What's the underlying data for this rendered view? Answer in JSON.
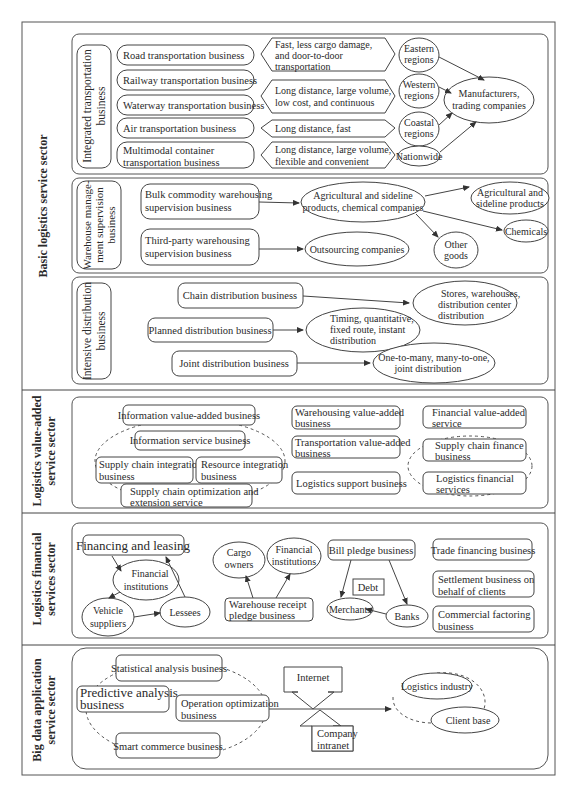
{
  "sectors": {
    "basic": {
      "label": "Basic logistics service sector",
      "transport": {
        "group_label_1": "Integrated transportation",
        "group_label_2": "business",
        "businesses": [
          [
            "Road transportation business"
          ],
          [
            "Railway transportation business"
          ],
          [
            "Waterway transportation business"
          ],
          [
            "Air transportation business"
          ],
          [
            "Multimodal container",
            "transportation business"
          ]
        ],
        "features": [
          [
            "Fast, less cargo damage,",
            "and door-to-door",
            "transportation"
          ],
          [
            "Long distance, large volume,",
            "low cost, and continuous"
          ],
          [
            "Long distance, fast"
          ],
          [
            "Long distance, large volume,",
            "flexible and convenient"
          ]
        ],
        "regions": [
          [
            "Eastern",
            "regions"
          ],
          [
            "Western",
            "regions"
          ],
          [
            "Coastal",
            "regions"
          ],
          [
            "Nationwide"
          ]
        ],
        "target": [
          "Manufacturers,",
          "trading companies"
        ]
      },
      "warehouse": {
        "group_label": [
          "Warehouse manage-",
          "ment supervision",
          "business"
        ],
        "businesses": [
          [
            "Bulk commodity warehousing",
            "supervision business"
          ],
          [
            "Third-party warehousing",
            "supervision business"
          ]
        ],
        "clients": [
          [
            "Agricultural and sideline",
            "products, chemical companies"
          ],
          [
            "Outsourcing companies"
          ]
        ],
        "goods": [
          [
            "Agricultural and",
            "sideline products"
          ],
          [
            "Chemicals"
          ],
          [
            "Other",
            "goods"
          ]
        ]
      },
      "distribution": {
        "group_label": [
          "Intensive distribution",
          "business"
        ],
        "businesses": [
          "Chain distribution business",
          "Planned distribution business",
          "Joint distribution business"
        ],
        "outcomes": [
          [
            "Stores, warehouses,",
            "distribution center",
            "distribution"
          ],
          [
            "Timing, quantitative,",
            "fixed route, instant",
            "distribution"
          ],
          [
            "One-to-many, many-to-one,",
            "joint distribution"
          ]
        ]
      }
    },
    "value_added": {
      "label": [
        "Logistics value-added",
        "service sector"
      ],
      "info_value_added": "Information value-added business",
      "info_service": "Information service business",
      "supply_chain_integration": [
        "Supply chain integration",
        "business"
      ],
      "resource_integration": [
        "Resource integration",
        "business"
      ],
      "supply_chain_optimization": [
        "Supply chain optimization and",
        "extension service"
      ],
      "warehousing_va": [
        "Warehousing value-added",
        "business"
      ],
      "transportation_va": [
        "Transportation value-added",
        "business"
      ],
      "logistics_support": "Logistics support business",
      "financial_va": [
        "Financial value-added",
        "service"
      ],
      "supply_chain_finance": [
        "Supply chain finance",
        "business"
      ],
      "logistics_financial": [
        "Logistics financial",
        "services"
      ]
    },
    "financial": {
      "label": [
        "Logistics financial",
        "services sector"
      ],
      "financing_leasing": "Financing and leasing",
      "financial_institutions": [
        "Financial",
        "institutions"
      ],
      "vehicle_suppliers": [
        "Vehicle",
        "suppliers"
      ],
      "lessees": "Lessees",
      "cargo_owners": [
        "Cargo",
        "owners"
      ],
      "financial_institutions_2": [
        "Financial",
        "institutions"
      ],
      "warehouse_receipt": [
        "Warehouse receipt",
        "pledge business"
      ],
      "bill_pledge": "Bill pledge business",
      "debt": "Debt",
      "merchants": "Merchants",
      "banks": "Banks",
      "trade_financing": "Trade financing business",
      "settlement": [
        "Settlement business on",
        "behalf of clients"
      ],
      "factoring": [
        "Commercial factoring",
        "business"
      ]
    },
    "big_data": {
      "label": [
        "Big data application",
        "service sector"
      ],
      "statistical": "Statistical analysis business",
      "predictive": [
        "Predictive analysis",
        "business"
      ],
      "operation": [
        "Operation optimization",
        "business"
      ],
      "smart_commerce": "Smart commerce business",
      "internet": "Internet",
      "intranet": [
        "Company",
        "intranet"
      ],
      "logistics_industry": "Logistics industry",
      "client_base": "Client base"
    }
  }
}
